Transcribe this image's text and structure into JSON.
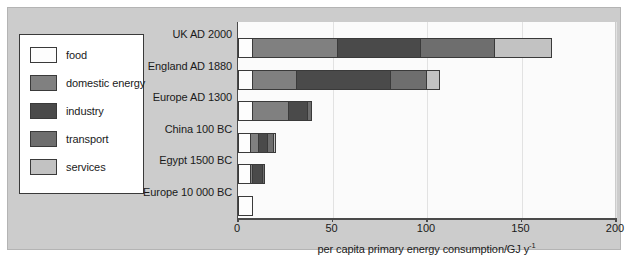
{
  "chart_data": {
    "type": "bar",
    "orientation": "horizontal",
    "stacked": true,
    "title": "",
    "xlabel": "per capita primary energy consumption/GJ y",
    "xlabel_sup": "-1",
    "ylabel": "",
    "xlim": [
      0,
      200
    ],
    "xticks": [
      0,
      50,
      100,
      150,
      200
    ],
    "xtick_labels": [
      "0",
      "50",
      "100",
      "150",
      "200"
    ],
    "grid": true,
    "grid_axis": "x",
    "legend_position": "left-outside",
    "categories": [
      "UK AD 2000",
      "England AD 1880",
      "Europe AD 1300",
      "China 100 BC",
      "Egypt 1500 BC",
      "Europe 10 000 BC"
    ],
    "series": [
      {
        "name": "food",
        "color": "#fdfdfd",
        "values": [
          7,
          7,
          7,
          6,
          6,
          7
        ]
      },
      {
        "name": "domestic energy",
        "color": "#808080",
        "values": [
          45,
          23,
          19,
          4,
          1,
          0
        ]
      },
      {
        "name": "industry",
        "color": "#4a4a4a",
        "values": [
          44,
          50,
          10,
          5,
          5,
          0
        ]
      },
      {
        "name": "transport",
        "color": "#6e6e6e",
        "values": [
          39,
          19,
          2,
          3,
          1,
          0
        ]
      },
      {
        "name": "services",
        "color": "#c2c2c2",
        "values": [
          30,
          7,
          0,
          1,
          0,
          0
        ]
      }
    ],
    "totals": [
      165,
      106,
      38,
      19,
      13,
      7
    ]
  },
  "legend": {
    "items": [
      {
        "label": "food",
        "color": "#fdfdfd"
      },
      {
        "label": "domestic energy",
        "color": "#808080"
      },
      {
        "label": "industry",
        "color": "#4a4a4a"
      },
      {
        "label": "transport",
        "color": "#6e6e6e"
      },
      {
        "label": "services",
        "color": "#c2c2c2"
      }
    ]
  },
  "colors": {
    "panel_background": "#cccccc",
    "plot_background": "#fbfbfb",
    "axis": "#4a4a4a",
    "gridline": "#e2e2e2",
    "text": "#1a1a1a",
    "outline": "#3a3a3a"
  }
}
